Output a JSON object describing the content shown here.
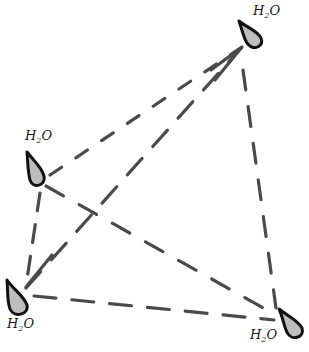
{
  "diagram": {
    "title": "",
    "colors": {
      "background": "#ffffff",
      "dash": "#4a4a4a",
      "droplet_fill": "#bdbdbd",
      "droplet_stroke": "#111111",
      "label": "#1a1a1a"
    },
    "nodes": [
      {
        "id": "top-right",
        "label_main": "H",
        "label_sub": "2",
        "label_end": "O",
        "x": 252,
        "y": 35,
        "label_x": 253,
        "label_y": 4
      },
      {
        "id": "mid-left",
        "label_main": "H",
        "label_sub": "2",
        "label_end": "O",
        "x": 38,
        "y": 175,
        "label_x": 25,
        "label_y": 129
      },
      {
        "id": "bottom-left",
        "label_main": "H",
        "label_sub": "2",
        "label_end": "O",
        "x": 18,
        "y": 296,
        "label_x": 7,
        "label_y": 317
      },
      {
        "id": "bottom-right",
        "label_main": "H",
        "label_sub": "2",
        "label_end": "O",
        "x": 292,
        "y": 322,
        "label_x": 250,
        "label_y": 328
      }
    ],
    "edges": [
      {
        "from": "mid-left",
        "to": "top-right",
        "arrow": false
      },
      {
        "from": "bottom-left",
        "to": "top-right",
        "arrow": true
      },
      {
        "from": "top-right",
        "to": "bottom-right",
        "arrow": false
      },
      {
        "from": "mid-left",
        "to": "bottom-right",
        "arrow": false
      },
      {
        "from": "bottom-left",
        "to": "bottom-right",
        "arrow": false
      },
      {
        "from": "mid-left",
        "to": "bottom-left",
        "arrow": true
      }
    ]
  }
}
